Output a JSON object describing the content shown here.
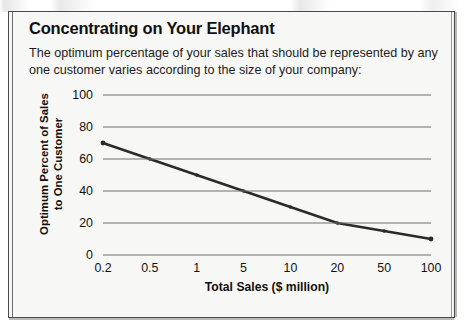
{
  "figure": {
    "headline": "Concentrating on Your Elephant",
    "intro": "The optimum percentage of your sales that should be represented by any one customer varies according to the size of your company:"
  },
  "chart_data": {
    "type": "line",
    "title": "Concentrating on Your Elephant",
    "subtitle": "The optimum percentage of your sales that should be represented by any one customer varies according to the size of your company:",
    "xlabel": "Total Sales ($ million)",
    "ylabel": "Optimum Percent of Sales\nto One Customer",
    "ylabel_line1": "Optimum Percent of Sales",
    "ylabel_line2": "to One Customer",
    "categories": [
      "0.2",
      "0.5",
      "1",
      "5",
      "10",
      "20",
      "50",
      "100"
    ],
    "values": [
      70,
      60,
      50,
      40,
      30,
      20,
      15,
      10
    ],
    "ylim": [
      0,
      100
    ],
    "yticks": [
      100,
      80,
      60,
      40,
      20,
      0
    ],
    "xticks": [
      "0.2",
      "0.5",
      "1",
      "5",
      "10",
      "20",
      "50",
      "100"
    ],
    "grid": "horizontal",
    "legend": "none",
    "line_color": "#2b2b2b",
    "marker": "dot",
    "x_scale": "categorical"
  },
  "colors": {
    "line": "#2b2b2b",
    "gridline": "#6f6f6f",
    "panel_background": "#f7f7f5",
    "border": "#4a4a4a",
    "text": "#111111"
  }
}
